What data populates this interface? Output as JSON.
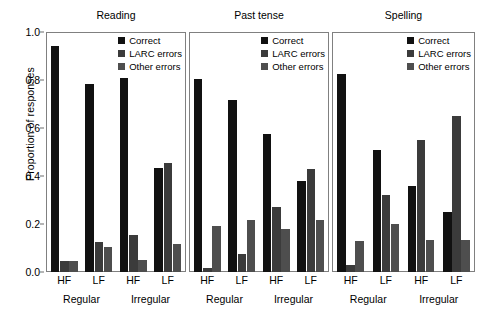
{
  "chart_data": {
    "type": "bar",
    "title": "",
    "ylabel": "Proportion of responses",
    "xlabel": "",
    "ylim": [
      0.0,
      1.0
    ],
    "yticks": [
      "0.0",
      "0.2",
      "0.4",
      "0.6",
      "0.8",
      "1.0"
    ],
    "ytick_values": [
      0.0,
      0.2,
      0.4,
      0.6,
      0.8,
      1.0
    ],
    "grid": false,
    "legend_position": "top-right",
    "categories": [
      "HF",
      "LF",
      "HF",
      "LF"
    ],
    "groups": [
      "Regular",
      "Irregular"
    ],
    "series_names": [
      "Correct",
      "LARC errors",
      "Other errors"
    ],
    "series_colors": [
      "#111111",
      "#3b3b3b",
      "#4e4e4e"
    ],
    "panels": [
      {
        "title": "Reading",
        "categories": [
          "HF",
          "LF",
          "HF",
          "LF"
        ],
        "groups": [
          "Regular",
          "Irregular"
        ],
        "series": [
          {
            "name": "Correct",
            "values": [
              0.94,
              0.785,
              0.81,
              0.435
            ]
          },
          {
            "name": "LARC errors",
            "values": [
              0.045,
              0.125,
              0.155,
              0.455
            ]
          },
          {
            "name": "Other errors",
            "values": [
              0.045,
              0.105,
              0.05,
              0.115
            ]
          }
        ]
      },
      {
        "title": "Past tense",
        "categories": [
          "HF",
          "LF",
          "HF",
          "LF"
        ],
        "groups": [
          "Regular",
          "Irregular"
        ],
        "series": [
          {
            "name": "Correct",
            "values": [
              0.805,
              0.715,
              0.575,
              0.38
            ]
          },
          {
            "name": "LARC errors",
            "values": [
              0.015,
              0.075,
              0.27,
              0.43
            ]
          },
          {
            "name": "Other errors",
            "values": [
              0.19,
              0.215,
              0.18,
              0.215
            ]
          }
        ]
      },
      {
        "title": "Spelling",
        "categories": [
          "HF",
          "LF",
          "HF",
          "LF"
        ],
        "groups": [
          "Regular",
          "Irregular"
        ],
        "series": [
          {
            "name": "Correct",
            "values": [
              0.825,
              0.51,
              0.36,
              0.25
            ]
          },
          {
            "name": "LARC errors",
            "values": [
              0.03,
              0.32,
              0.55,
              0.65
            ]
          },
          {
            "name": "Other errors",
            "values": [
              0.13,
              0.2,
              0.135,
              0.135
            ]
          }
        ]
      }
    ]
  }
}
